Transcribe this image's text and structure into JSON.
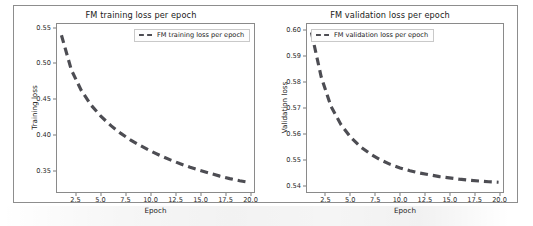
{
  "figure": {
    "panels": [
      {
        "id": "training",
        "title": "FM training loss per epoch",
        "xlabel": "Epoch",
        "ylabel": "Training loss",
        "legend_label": "FM training loss per epoch",
        "xticks": [
          "2.5",
          "5.0",
          "7.5",
          "10.0",
          "12.5",
          "15.0",
          "17.5",
          "20.0"
        ],
        "yticks": [
          "0.35",
          "0.40",
          "0.45",
          "0.50",
          "0.55"
        ]
      },
      {
        "id": "validation",
        "title": "FM validation loss per epoch",
        "xlabel": "Epoch",
        "ylabel": "Validation loss",
        "legend_label": "FM validation loss per epoch",
        "xticks": [
          "2.5",
          "5.0",
          "7.5",
          "10.0",
          "12.5",
          "15.0",
          "17.5",
          "20.0"
        ],
        "yticks": [
          "0.54",
          "0.55",
          "0.56",
          "0.57",
          "0.58",
          "0.59",
          "0.60"
        ]
      }
    ],
    "line_color": "#4d4d53"
  },
  "chart_data": [
    {
      "type": "line",
      "title": "FM training loss per epoch",
      "xlabel": "Epoch",
      "ylabel": "Training loss",
      "legend": [
        "FM training loss per epoch"
      ],
      "legend_position": "upper right",
      "grid": false,
      "linestyle": "dashed",
      "xlim": [
        0.55,
        20.45
      ],
      "ylim": [
        0.3185,
        0.5565
      ],
      "xticks": [
        2.5,
        5.0,
        7.5,
        10.0,
        12.5,
        15.0,
        17.5,
        20.0
      ],
      "yticks": [
        0.35,
        0.4,
        0.45,
        0.5,
        0.55
      ],
      "x": [
        1,
        2,
        3,
        4,
        5,
        6,
        7,
        8,
        9,
        10,
        11,
        12,
        13,
        14,
        15,
        16,
        17,
        18,
        19,
        20
      ],
      "series": [
        {
          "name": "FM training loss per epoch",
          "values": [
            0.5405,
            0.4915,
            0.4625,
            0.4415,
            0.4255,
            0.4125,
            0.4015,
            0.392,
            0.384,
            0.3765,
            0.37,
            0.364,
            0.3585,
            0.3535,
            0.349,
            0.345,
            0.341,
            0.3375,
            0.3345,
            0.332
          ]
        }
      ]
    },
    {
      "type": "line",
      "title": "FM validation loss per epoch",
      "xlabel": "Epoch",
      "ylabel": "Validation loss",
      "legend": [
        "FM validation loss per epoch"
      ],
      "legend_position": "upper left",
      "grid": false,
      "linestyle": "dashed",
      "xlim": [
        0.55,
        20.45
      ],
      "ylim": [
        0.5372,
        0.6028
      ],
      "xticks": [
        2.5,
        5.0,
        7.5,
        10.0,
        12.5,
        15.0,
        17.5,
        20.0
      ],
      "yticks": [
        0.54,
        0.55,
        0.56,
        0.57,
        0.58,
        0.59,
        0.6
      ],
      "x": [
        1,
        2,
        3,
        4,
        5,
        6,
        7,
        8,
        9,
        10,
        11,
        12,
        13,
        14,
        15,
        16,
        17,
        18,
        19,
        20
      ],
      "series": [
        {
          "name": "FM validation loss per epoch",
          "values": [
            0.5995,
            0.582,
            0.5705,
            0.5635,
            0.5585,
            0.5548,
            0.552,
            0.5498,
            0.548,
            0.5466,
            0.5455,
            0.5446,
            0.5439,
            0.5432,
            0.5427,
            0.5422,
            0.5418,
            0.5415,
            0.5412,
            0.541
          ]
        }
      ]
    }
  ]
}
